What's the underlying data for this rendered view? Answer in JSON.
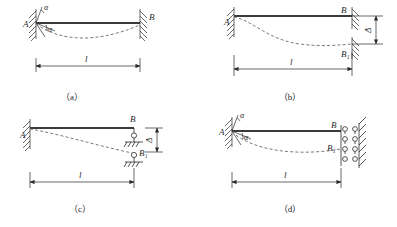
{
  "figure": {
    "type": "engineering-diagram",
    "width": 397,
    "height": 227,
    "background_color": "#ffffff",
    "line_color": "#2a2a2a",
    "beam_color": "#3a3a3a",
    "dashed_color": "#6a6a6a"
  },
  "panels": [
    {
      "id": "a",
      "caption": "（a）",
      "left_label": "A",
      "right_label": "B",
      "span_label": "l",
      "angle_label_top": "α",
      "angle_label_lower": "α",
      "left_support": "fixed-hatched-wall-with-rotation",
      "right_support": "fixed-hatched-wall",
      "deflection": "sagging-dashed-curve"
    },
    {
      "id": "b",
      "caption": "（b）",
      "left_label": "A",
      "right_label": "B",
      "displaced_label": "B₁",
      "span_label": "l",
      "delta_label": "Δ",
      "left_support": "fixed-hatched-wall",
      "right_support": "fixed-hatched-wall-displaced",
      "deflection": "s-curve-dashed"
    },
    {
      "id": "c",
      "caption": "（c）",
      "left_label": "A",
      "right_label": "B",
      "displaced_label": "B₁",
      "span_label": "l",
      "delta_label": "Δ",
      "left_support": "fixed-hatched-wall",
      "right_support": "pin-roller-ground",
      "deflection": "cantilever-dashed-curve"
    },
    {
      "id": "d",
      "caption": "（d）",
      "left_label": "A",
      "right_label": "B",
      "displaced_label": "B₁",
      "span_label": "l",
      "angle_label_top": "α",
      "angle_label_lower": "α",
      "left_support": "fixed-hatched-wall-with-rotation",
      "right_support": "vertical-roller-guide-wall",
      "deflection": "sagging-dashed-curve"
    }
  ]
}
